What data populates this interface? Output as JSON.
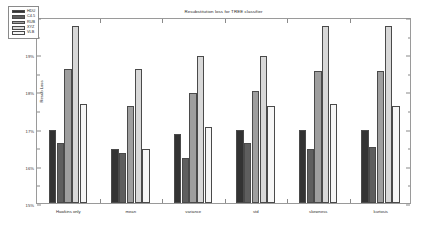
{
  "chart_data": {
    "type": "bar",
    "title": "Resubstitution loss for TREE classifier",
    "xlabel": "",
    "ylabel": "Resub Loss",
    "ylim": [
      15,
      20
    ],
    "ytick_values": [
      15,
      15.5,
      16,
      16.5,
      17,
      17.5,
      18,
      18.5,
      19,
      19.5,
      20
    ],
    "ytick_labels": [
      "15%",
      "15.5%",
      "16%",
      "16.5%",
      "17%",
      "17.5%",
      "18%",
      "18.5%",
      "19%",
      "19.5%",
      "20%"
    ],
    "grid": false,
    "legend_position": "upper left",
    "categories": [
      "Hawkins only",
      "mean",
      "variance",
      "std",
      "skewness",
      "kurtosis"
    ],
    "series": [
      {
        "name": "HDU",
        "color": "#333333",
        "values": [
          16.95,
          16.45,
          16.85,
          16.95,
          16.95,
          16.95
        ]
      },
      {
        "name": "C4.5",
        "color": "#5e5e5e",
        "values": [
          16.6,
          16.35,
          16.2,
          16.6,
          16.45,
          16.5
        ]
      },
      {
        "name": "RUB",
        "color": "#9e9e9e",
        "values": [
          18.6,
          17.6,
          17.95,
          18.0,
          18.55,
          18.55
        ]
      },
      {
        "name": "XYZ",
        "color": "#d8d8d8",
        "values": [
          19.75,
          18.6,
          18.95,
          18.95,
          19.75,
          19.75
        ]
      },
      {
        "name": "VLB",
        "color": "#f6f6f6",
        "values": [
          17.65,
          16.45,
          17.05,
          17.6,
          17.65,
          17.6
        ]
      }
    ]
  }
}
